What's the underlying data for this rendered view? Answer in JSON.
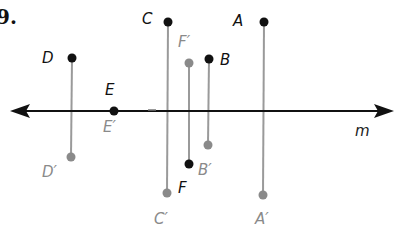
{
  "problem_number": "9.",
  "line": {
    "label": "m",
    "y": 111,
    "x1": 12,
    "x2": 392
  },
  "colors": {
    "original": "#111111",
    "image": "#8a8a8a",
    "connector": "#9a9a9a",
    "line": "#111111"
  },
  "points": [
    {
      "name": "D",
      "x": 72,
      "y": 58,
      "label": "D",
      "lx": 42,
      "ly": 63,
      "image": {
        "x": 71,
        "y": 157,
        "label": "D′",
        "lx": 42,
        "ly": 177
      }
    },
    {
      "name": "E",
      "x": 114,
      "y": 111,
      "label": "E",
      "lx": 105,
      "ly": 95,
      "image": {
        "x": 114,
        "y": 111,
        "label": "E′",
        "lx": 103,
        "ly": 132
      }
    },
    {
      "name": "C",
      "x": 168,
      "y": 22,
      "label": "C",
      "lx": 142,
      "ly": 24,
      "image": {
        "x": 167,
        "y": 193,
        "label": "C′",
        "lx": 154,
        "ly": 224
      }
    },
    {
      "name": "F",
      "x": 189,
      "y": 164,
      "label": "F",
      "lx": 178,
      "ly": 193,
      "image": {
        "x": 189,
        "y": 63,
        "label": "F′",
        "lx": 178,
        "ly": 47
      }
    },
    {
      "name": "B",
      "x": 209,
      "y": 59,
      "label": "B",
      "lx": 220,
      "ly": 65,
      "image": {
        "x": 208,
        "y": 145,
        "label": "B′",
        "lx": 198,
        "ly": 175
      }
    },
    {
      "name": "A",
      "x": 264,
      "y": 22,
      "label": "A",
      "lx": 233,
      "ly": 26,
      "image": {
        "x": 263,
        "y": 195,
        "label": "A′",
        "lx": 255,
        "ly": 224
      }
    }
  ],
  "line_label": {
    "text": "m",
    "x": 355,
    "y": 136
  }
}
